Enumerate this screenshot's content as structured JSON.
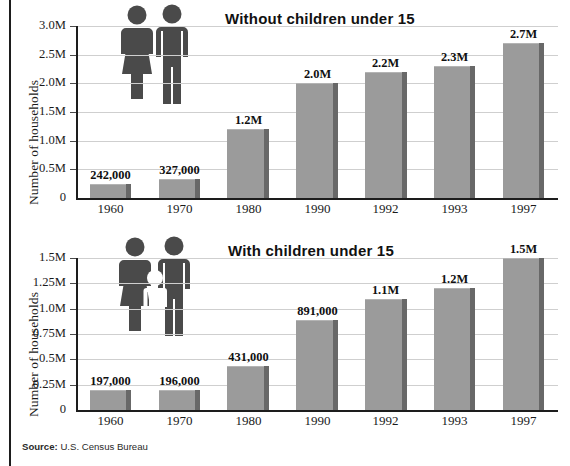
{
  "figure": {
    "source_prefix": "Source:",
    "source_text": "U.S. Census Bureau",
    "bar_color": "#9b9b9b",
    "bar_shadow_color": "#686868",
    "gridline_color": "#cfcfcf",
    "axis_color": "#1d1d1d",
    "pictogram_color": "#4a4a4a",
    "background": "#ffffff"
  },
  "chart_data": [
    {
      "type": "bar",
      "title": "Without children under 15",
      "xlabel": "",
      "ylabel": "Number of households",
      "categories": [
        "1960",
        "1970",
        "1980",
        "1990",
        "1992",
        "1993",
        "1997"
      ],
      "values": [
        242000,
        327000,
        1200000,
        2000000,
        2200000,
        2300000,
        2700000
      ],
      "value_labels": [
        "242,000",
        "327,000",
        "1.2M",
        "2.0M",
        "2.2M",
        "2.3M",
        "2.7M"
      ],
      "ytick_labels": [
        "0",
        "0.5M",
        "1.0M",
        "1.5M",
        "2.0M",
        "2.5M",
        "3.0M"
      ],
      "ytick_values": [
        0,
        500000,
        1000000,
        1500000,
        2000000,
        2500000,
        3000000
      ],
      "ylim": [
        0,
        3000000
      ],
      "grid": true,
      "legend": "none",
      "pictogram": "woman-man"
    },
    {
      "type": "bar",
      "title": "With children under 15",
      "xlabel": "",
      "ylabel": "Number of households",
      "categories": [
        "1960",
        "1970",
        "1980",
        "1990",
        "1992",
        "1993",
        "1997"
      ],
      "values": [
        197000,
        196000,
        431000,
        891000,
        1100000,
        1200000,
        1500000
      ],
      "value_labels": [
        "197,000",
        "196,000",
        "431,000",
        "891,000",
        "1.1M",
        "1.2M",
        "1.5M"
      ],
      "ytick_labels": [
        "0",
        "0.25M",
        "0.5M",
        "0.75M",
        "1.0M",
        "1.25M",
        "1.5M"
      ],
      "ytick_values": [
        0,
        250000,
        500000,
        750000,
        1000000,
        1250000,
        1500000
      ],
      "ylim": [
        0,
        1500000
      ],
      "grid": true,
      "legend": "none",
      "pictogram": "woman-child-man"
    }
  ]
}
